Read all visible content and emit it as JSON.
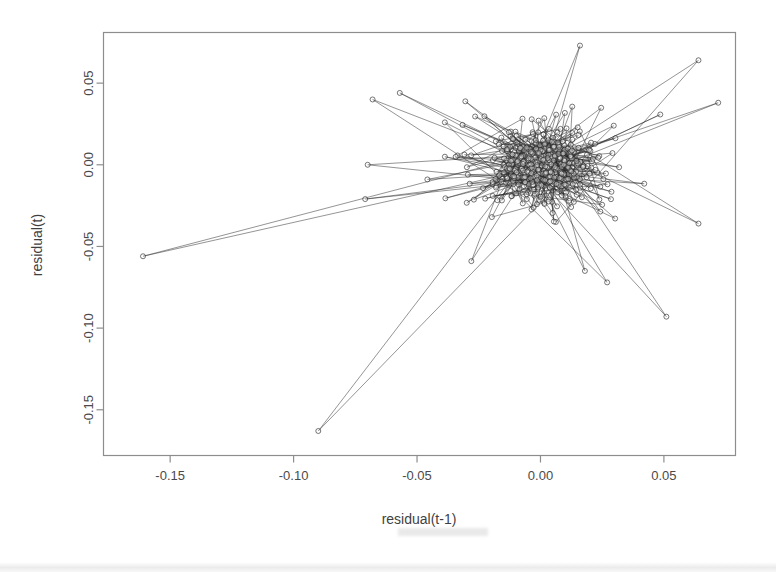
{
  "chart_data": {
    "type": "scatter",
    "title": "",
    "subtitle": "",
    "xlabel": "residual(t-1)",
    "ylabel": "residual(t)",
    "xlim": [
      -0.177,
      0.079
    ],
    "ylim": [
      -0.178,
      0.081
    ],
    "xticks": [
      -0.15,
      -0.1,
      -0.05,
      0.0,
      0.05
    ],
    "xticklabels": [
      "-0.15",
      "-0.10",
      "-0.05",
      "0.00",
      "0.05"
    ],
    "yticks": [
      -0.15,
      -0.1,
      -0.05,
      0.0,
      0.05
    ],
    "yticklabels": [
      "-0.15",
      "-0.10",
      "-0.05",
      "0.00",
      "0.05"
    ],
    "grid": false,
    "legend": false,
    "legend_position": "none",
    "marker": "open-circle",
    "marker_size_px": 5,
    "connected": true,
    "line_color": "#2b2b2b",
    "marker_edge_color": "#1c1c1c",
    "frame_color": "#8d8d8d",
    "n_points": 640,
    "cloud": {
      "center_x": 0.0,
      "center_y": 0.0,
      "sd_x": 0.0155,
      "sd_y": 0.015,
      "correlation": 0.05,
      "dense_core_fraction": 0.62,
      "dense_core_sd_scale": 0.45
    },
    "outliers": [
      {
        "x": -0.161,
        "y": -0.056
      },
      {
        "x": -0.09,
        "y": -0.163
      },
      {
        "x": 0.051,
        "y": -0.093
      },
      {
        "x": 0.064,
        "y": 0.064
      },
      {
        "x": 0.072,
        "y": 0.038
      },
      {
        "x": 0.064,
        "y": -0.036
      },
      {
        "x": 0.016,
        "y": 0.073
      },
      {
        "x": -0.068,
        "y": 0.04
      },
      {
        "x": -0.057,
        "y": 0.044
      },
      {
        "x": -0.07,
        "y": 0.0
      },
      {
        "x": -0.071,
        "y": -0.021
      },
      {
        "x": -0.028,
        "y": -0.059
      },
      {
        "x": 0.027,
        "y": -0.072
      },
      {
        "x": 0.018,
        "y": -0.065
      }
    ]
  },
  "axes": {
    "y_axis_label": "residual(t)",
    "x_axis_label": "residual(t-1)",
    "y_tick_labels": [
      "0.05",
      "0.00",
      "-0.05",
      "-0.10",
      "-0.15"
    ],
    "x_tick_labels": [
      "-0.15",
      "-0.10",
      "-0.05",
      "0.00",
      "0.05"
    ]
  },
  "colors": {
    "background": "#ffffff",
    "frame": "#8d8d8d",
    "data": "#1c1c1c",
    "text": "#3f3f3f"
  }
}
